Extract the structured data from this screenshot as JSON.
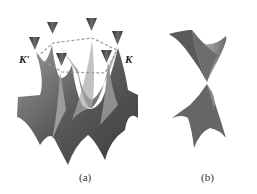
{
  "figure": {
    "panels": [
      {
        "id": "a",
        "label": "(a)",
        "description": "Graphene band structure with six Dirac cones at Brillouin zone corners",
        "point_labels": [
          "K'",
          "K"
        ]
      },
      {
        "id": "b",
        "label": "(b)",
        "description": "Single Dirac cone (zoom at K point)"
      }
    ],
    "colors": {
      "surface_dark": "#4a4a4a",
      "surface_mid": "#7a7a7a",
      "surface_light": "#b0b0b0",
      "dashed_hexagon": "#9a9a9a"
    }
  }
}
